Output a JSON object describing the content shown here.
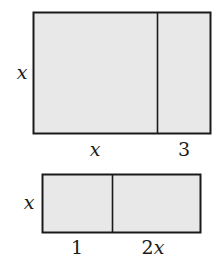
{
  "diagram": {
    "colors": {
      "fill": "#e8e8e8",
      "stroke": "#1a1a1a",
      "background": "#ffffff"
    },
    "large_rectangle": {
      "height_label": "x",
      "segments": [
        {
          "width_label": "x"
        },
        {
          "width_label": "3"
        }
      ]
    },
    "small_rectangle": {
      "height_label": "x",
      "segments": [
        {
          "width_label": "1"
        },
        {
          "width_label": "2x",
          "coef": "2",
          "var": "x"
        }
      ]
    }
  }
}
